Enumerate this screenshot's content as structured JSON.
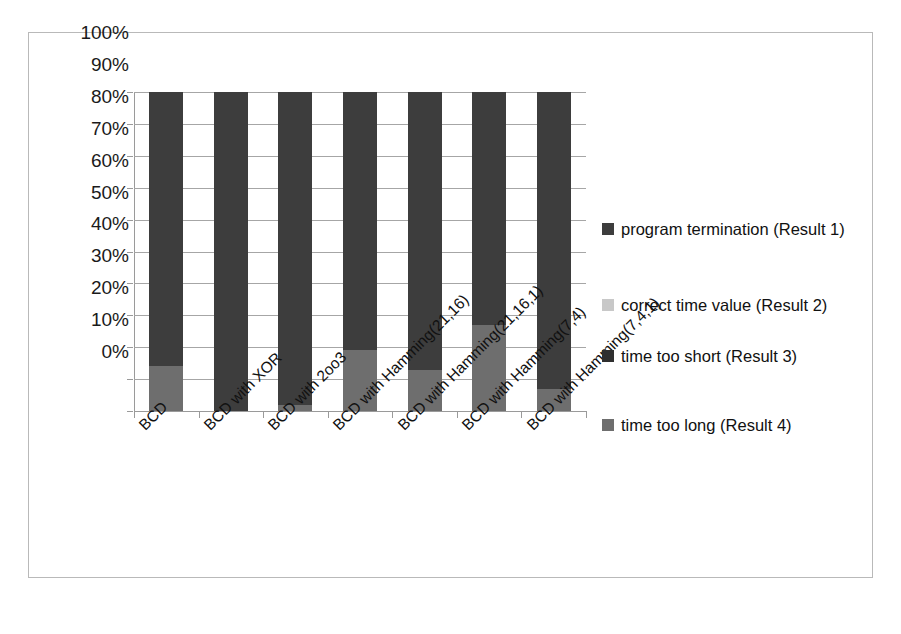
{
  "chart_data": {
    "type": "bar",
    "subtype": "stacked-100-percent",
    "title": "",
    "xlabel": "",
    "ylabel": "",
    "ylim": [
      0,
      100
    ],
    "grid": true,
    "legend_position": "right",
    "y_ticks": [
      "0%",
      "10%",
      "20%",
      "30%",
      "40%",
      "50%",
      "60%",
      "70%",
      "80%",
      "90%",
      "100%"
    ],
    "categories": [
      "BCD",
      "BCD with XOR",
      "BCD with 2oo3",
      "BCD with Hamming(21,16)",
      "BCD with Hamming(21,16,1)",
      "BCD with Hamming(7,4)",
      "BCD with Hamming(7,4,1)"
    ],
    "series": [
      {
        "name": "program termination (Result 1)",
        "color": "#3d3d3d",
        "values": [
          86,
          100,
          98,
          81,
          87,
          73,
          93
        ]
      },
      {
        "name": "correct time value (Result 2)",
        "color": "#c8c8c8",
        "values": [
          0,
          0,
          0,
          0,
          0,
          0,
          0
        ]
      },
      {
        "name": "time too short (Result 3)",
        "color": "#2f2f2f",
        "values": [
          0,
          0,
          0,
          0,
          0,
          0,
          0
        ]
      },
      {
        "name": "time too long (Result 4)",
        "color": "#6e6e6e",
        "values": [
          14,
          0,
          2,
          19,
          13,
          27,
          7
        ]
      }
    ]
  },
  "legend": {
    "entries": [
      {
        "label": "program termination (Result 1)",
        "color": "#3d3d3d"
      },
      {
        "label": "correct time value (Result 2)",
        "color": "#c8c8c8"
      },
      {
        "label": "time too short (Result 3)",
        "color": "#2f2f2f"
      },
      {
        "label": "time too long (Result 4)",
        "color": "#6e6e6e"
      }
    ]
  }
}
